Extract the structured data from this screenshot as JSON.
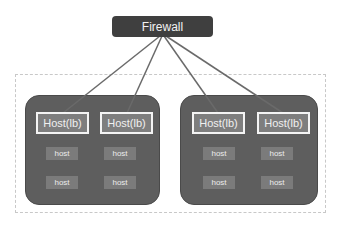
{
  "firewall": {
    "label": "Firewall"
  },
  "clusters": [
    {
      "load_balancers": [
        {
          "label": "Host(lb)"
        },
        {
          "label": "Host(lb)"
        }
      ],
      "hosts": [
        {
          "label": "host"
        },
        {
          "label": "host"
        },
        {
          "label": "host"
        },
        {
          "label": "host"
        }
      ]
    },
    {
      "load_balancers": [
        {
          "label": "Host(lb)"
        },
        {
          "label": "Host(lb)"
        }
      ],
      "hosts": [
        {
          "label": "host"
        },
        {
          "label": "host"
        },
        {
          "label": "host"
        },
        {
          "label": "host"
        }
      ]
    }
  ],
  "colors": {
    "firewall_bg": "#3f3f3f",
    "cluster_bg": "#5e5e5e",
    "lb_bg": "#7e7e7e",
    "host_bg": "#7b7b7b",
    "connector": "#6a6a6a",
    "zone_border": "#c8c8c8"
  }
}
